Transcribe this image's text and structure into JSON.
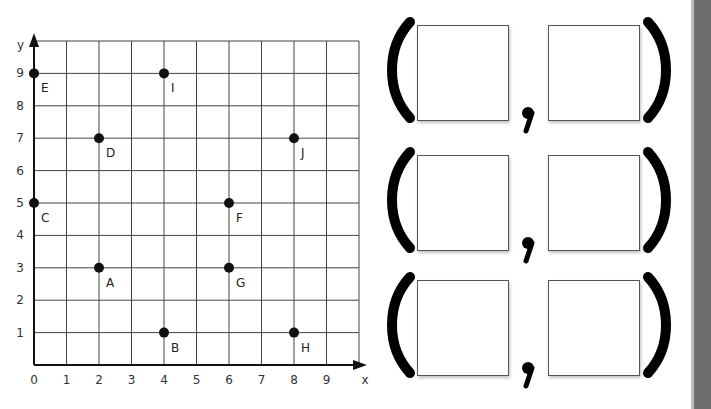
{
  "grid": {
    "x_axis_label": "x",
    "y_axis_label": "y",
    "x_ticks": [
      "0",
      "1",
      "2",
      "3",
      "4",
      "5",
      "6",
      "7",
      "8",
      "9"
    ],
    "y_ticks": [
      "1",
      "2",
      "3",
      "4",
      "5",
      "6",
      "7",
      "8",
      "9"
    ],
    "points": [
      {
        "label": "A",
        "x": 2,
        "y": 3
      },
      {
        "label": "B",
        "x": 4,
        "y": 1
      },
      {
        "label": "C",
        "x": 0,
        "y": 5
      },
      {
        "label": "D",
        "x": 2,
        "y": 7
      },
      {
        "label": "E",
        "x": 0,
        "y": 9
      },
      {
        "label": "F",
        "x": 6,
        "y": 5
      },
      {
        "label": "G",
        "x": 6,
        "y": 3
      },
      {
        "label": "H",
        "x": 8,
        "y": 1
      },
      {
        "label": "I",
        "x": 4,
        "y": 9
      },
      {
        "label": "J",
        "x": 8,
        "y": 7
      }
    ]
  },
  "answers": {
    "rows": [
      {
        "x_value": "",
        "y_value": ""
      },
      {
        "x_value": "",
        "y_value": ""
      },
      {
        "x_value": "",
        "y_value": ""
      }
    ]
  },
  "colors": {
    "ink": "#111111",
    "grid": "#444444",
    "scrollbar": "#6e6e6e"
  }
}
